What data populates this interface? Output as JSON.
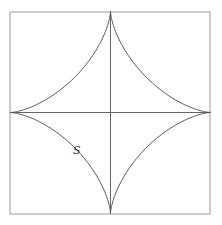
{
  "diagram": {
    "type": "astroid-in-square",
    "label": "S",
    "frame": {
      "x": 10,
      "y": 12,
      "width": 200,
      "height": 202,
      "stroke": "#9a9a9a"
    },
    "center": {
      "x": 110.5,
      "y": 112.5
    },
    "radius": 100,
    "curve_color": "#555555",
    "axis_color": "#666666"
  }
}
